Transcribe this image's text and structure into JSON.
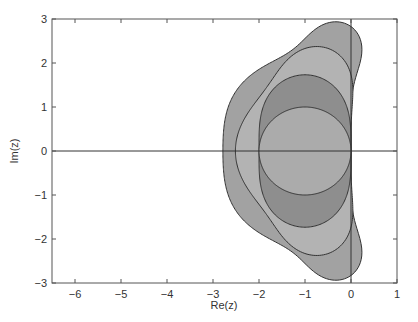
{
  "chart_data": {
    "type": "area",
    "title": "",
    "xlabel": "Re(z)",
    "ylabel": "Im(z)",
    "xlim": [
      -6.5,
      1
    ],
    "ylim": [
      -3,
      3
    ],
    "xticks": [
      -6,
      -5,
      -4,
      -3,
      -2,
      -1,
      0,
      1
    ],
    "yticks": [
      -3,
      -2,
      -1,
      0,
      1,
      2,
      3
    ],
    "xtick_labels": [
      "−6",
      "−5",
      "−4",
      "−3",
      "−2",
      "−1",
      "0",
      "1"
    ],
    "ytick_labels": [
      "−3",
      "−2",
      "−1",
      "0",
      "1",
      "2",
      "3"
    ],
    "grid": false,
    "legend": null,
    "series": [
      {
        "name": "order 4 stability region",
        "order": 4,
        "real_axis_extent": -2.785,
        "imag_axis_extent": 2.828,
        "fill": "#a2a2a2"
      },
      {
        "name": "order 3 stability region",
        "order": 3,
        "real_axis_extent": -2.513,
        "imag_axis_extent": 1.732,
        "fill": "#b3b3b3"
      },
      {
        "name": "order 2 stability region",
        "order": 2,
        "real_axis_extent": -2.0,
        "imag_axis_extent": 0.0,
        "fill": "#8e8e8e"
      },
      {
        "name": "order 1 stability region",
        "order": 1,
        "real_axis_extent": -2.0,
        "imag_axis_extent": 0.0,
        "center": [
          -1,
          0
        ],
        "radius": 1,
        "fill": "#ababab"
      }
    ],
    "reference_lines": {
      "x": 0,
      "y": 0
    }
  }
}
